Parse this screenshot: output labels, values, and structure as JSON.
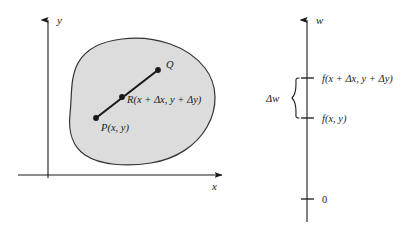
{
  "figure": {
    "background_color": "#ffffff",
    "ink_color": "#1a1a1a",
    "region_fill_color": "#dcdcdc",
    "region_stroke_color": "#333333"
  },
  "left_panel": {
    "name": "xy-plane-with-region",
    "axes": {
      "x_label": "x",
      "y_label": "y",
      "origin": {
        "x": 48,
        "y": 175
      }
    },
    "region": {
      "name": "closed-region-blob",
      "fill": "#dcdcdc"
    },
    "points": [
      {
        "id": "P",
        "label": "P(x, y)",
        "label_parts": {
          "name": "P",
          "args": "(x, y)"
        },
        "cx": 96,
        "cy": 118,
        "label_x": 101,
        "label_y": 130
      },
      {
        "id": "R",
        "label": "R(x + Δx, y + Δy)",
        "label_parts": {
          "name": "R",
          "args": "(x + Δx, y + Δy)"
        },
        "cx": 122,
        "cy": 97,
        "label_x": 127,
        "label_y": 103
      },
      {
        "id": "Q",
        "label": "Q",
        "label_parts": {
          "name": "Q",
          "args": ""
        },
        "cx": 158,
        "cy": 70,
        "label_x": 166,
        "label_y": 68
      }
    ],
    "segment": {
      "name": "segment-P-to-Q",
      "from": "P",
      "to": "Q"
    }
  },
  "right_panel": {
    "name": "w-axis-number-line",
    "axis": {
      "label": "w",
      "x": 307,
      "top_y": 14,
      "bottom_y": 222
    },
    "ticks": [
      {
        "id": "tick-upper",
        "value_label": "f(x + Δx, y + Δy)",
        "y": 78,
        "label_x": 322
      },
      {
        "id": "tick-lower",
        "value_label": "f(x, y)",
        "y": 118,
        "label_x": 322
      },
      {
        "id": "tick-zero",
        "value_label": "0",
        "y": 199,
        "label_x": 322
      }
    ],
    "brace": {
      "name": "delta-w-brace",
      "label": "Δw",
      "label_x": 275,
      "label_y": 101,
      "top_y": 78,
      "bottom_y": 118,
      "x": 296
    }
  }
}
